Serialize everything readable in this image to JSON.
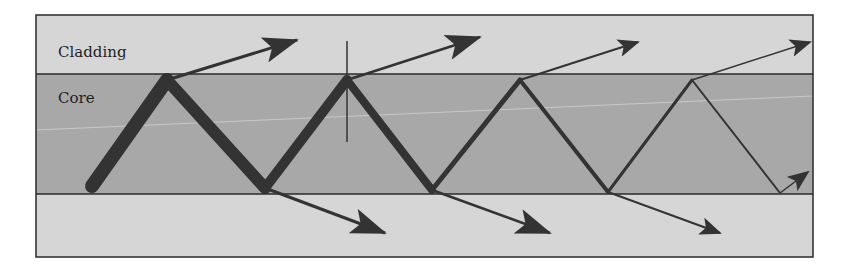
{
  "diagram": {
    "type": "optical-fiber-ray-propagation",
    "labels": {
      "cladding": "Cladding",
      "core": "Core"
    },
    "colors": {
      "background": "#ffffff",
      "cladding_fill": "#d6d6d6",
      "core_fill": "#a8a8a8",
      "ray": "#333333",
      "border": "#2a2a2a",
      "axis_line": "#c8c8c8"
    },
    "regions": [
      {
        "name": "upper-cladding",
        "label_key": "cladding"
      },
      {
        "name": "core",
        "label_key": "core"
      },
      {
        "name": "lower-cladding"
      }
    ],
    "ray_path": {
      "description": "Zigzag ray in core with decreasing intensity (thickness) after each reflection; refracted rays leak into cladding at each bounce",
      "vertices": [
        [
          92,
          186
        ],
        [
          167,
          80
        ],
        [
          265,
          188
        ],
        [
          347,
          80
        ],
        [
          432,
          190
        ],
        [
          520,
          80
        ],
        [
          608,
          192
        ],
        [
          692,
          80
        ],
        [
          780,
          193
        ]
      ],
      "segment_widths": [
        14,
        12,
        10,
        8,
        5,
        4,
        3,
        2
      ]
    },
    "refracted_rays_up": [
      {
        "from": [
          167,
          80
        ],
        "to": [
          297,
          40
        ]
      },
      {
        "from": [
          347,
          80
        ],
        "to": [
          480,
          37
        ]
      },
      {
        "from": [
          520,
          80
        ],
        "to": [
          638,
          42
        ]
      },
      {
        "from": [
          692,
          80
        ],
        "to": [
          810,
          42
        ]
      }
    ],
    "refracted_rays_down": [
      {
        "from": [
          265,
          188
        ],
        "to": [
          385,
          233
        ]
      },
      {
        "from": [
          432,
          190
        ],
        "to": [
          550,
          233
        ]
      },
      {
        "from": [
          608,
          192
        ],
        "to": [
          720,
          233
        ]
      },
      {
        "from": [
          780,
          193
        ],
        "to": [
          808,
          172
        ]
      }
    ],
    "normal_line": {
      "x": 347,
      "y1": 41,
      "y2": 142
    }
  }
}
